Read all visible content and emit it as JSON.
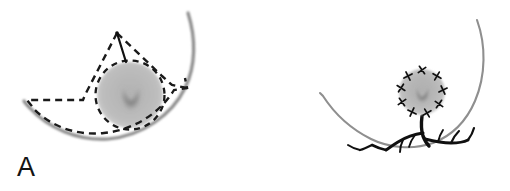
{
  "figure": {
    "width": 510,
    "height": 191,
    "background_color": "#ffffff",
    "panel_count": 2
  },
  "colors": {
    "background": "#ffffff",
    "outline_gray": "#7d7d7d",
    "outline_gray_light": "#9e9e9e",
    "dashed_outline": "#1a1a1a",
    "blob_outer": "#c9c9c9",
    "blob_mid": "#a8a8a8",
    "blob_core": "#5d5d5d",
    "branch_dark": "#101010",
    "marker_dark": "#101010",
    "label_text": "#141414"
  },
  "panel_a": {
    "label": "A",
    "description": "Grayscale radiograph-like image: crescent/bowl shaped gray arc with a dashed black outline traced around a wedge region and a round gray mass; a solid black line descends from the dashed apex to the mass.",
    "elements": {
      "gray_arc_name": "crescent-arc",
      "dashed_outline_name": "dashed-region-outline",
      "apex_line_name": "apex-measurement-line",
      "mass_name": "round-gray-mass",
      "mass_dashed_ring_name": "mass-dashed-ring"
    },
    "mass": {
      "center_x": 130,
      "center_y": 95,
      "radius": 34
    }
  },
  "panel_b": {
    "label": "B",
    "description": "Grayscale radiograph-like image: thin gray bowl arc with a round gray mass ringed by nine small dark X-shaped markers, and a dark branching root-like structure descending from the mass to the arc.",
    "elements": {
      "gray_arc_name": "crescent-arc",
      "mass_name": "round-gray-mass",
      "markers_name": "perimeter-x-markers",
      "branch_name": "branching-dark-structure"
    },
    "mass": {
      "center_x": 167,
      "center_y": 92,
      "radius": 23
    },
    "marker_count": 9,
    "marker_glyph": "x-marker"
  }
}
